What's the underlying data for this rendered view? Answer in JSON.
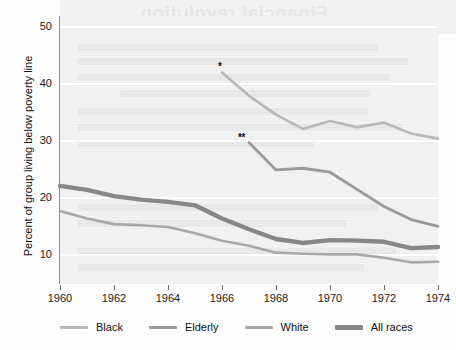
{
  "figure": {
    "y_axis_title": "Percent of group living below poverty line",
    "bleed_text": "Financial revolution",
    "footnote_single": "*",
    "footnote_double": "**"
  },
  "chart_data": {
    "type": "line",
    "title": "",
    "xlabel": "",
    "ylabel": "Percent of group living below poverty line",
    "xlim": [
      1960,
      1974
    ],
    "ylim": [
      5,
      52
    ],
    "yticks": [
      10,
      20,
      30,
      40,
      50
    ],
    "xticks": [
      1960,
      1962,
      1964,
      1966,
      1968,
      1970,
      1972,
      1974
    ],
    "grid": "horizontal-white",
    "legend_position": "below",
    "series": [
      {
        "name": "Black",
        "color": "#b8b8b8",
        "width": 2.6,
        "marker_note": "*",
        "x": [
          1966,
          1967,
          1968,
          1969,
          1970,
          1971,
          1972,
          1973,
          1974
        ],
        "values": [
          42.1,
          38.0,
          34.7,
          32.2,
          33.6,
          32.5,
          33.3,
          31.4,
          30.5
        ]
      },
      {
        "name": "Elderly",
        "color": "#9a9a9a",
        "width": 2.8,
        "marker_note": "**",
        "x": [
          1967,
          1968,
          1969,
          1970,
          1971,
          1972,
          1973,
          1974
        ],
        "values": [
          29.8,
          25.0,
          25.3,
          24.6,
          21.6,
          18.6,
          16.3,
          15.1
        ]
      },
      {
        "name": "White",
        "color": "#a8a8a8",
        "width": 2.6,
        "marker_note": "",
        "x": [
          1960,
          1961,
          1962,
          1963,
          1964,
          1965,
          1966,
          1967,
          1968,
          1969,
          1970,
          1971,
          1972,
          1973,
          1974
        ],
        "values": [
          17.8,
          16.5,
          15.5,
          15.3,
          15.0,
          13.9,
          12.6,
          11.7,
          10.5,
          10.3,
          10.2,
          10.2,
          9.6,
          8.8,
          8.9
        ]
      },
      {
        "name": "All races",
        "color": "#878787",
        "width": 4.4,
        "marker_note": "",
        "x": [
          1960,
          1961,
          1962,
          1963,
          1964,
          1965,
          1966,
          1967,
          1968,
          1969,
          1970,
          1971,
          1972,
          1973,
          1974
        ],
        "values": [
          22.2,
          21.5,
          20.4,
          19.8,
          19.4,
          18.8,
          16.5,
          14.6,
          12.9,
          12.2,
          12.7,
          12.6,
          12.4,
          11.3,
          11.5
        ]
      }
    ]
  },
  "legend": {
    "items": [
      {
        "label": "Black",
        "color": "#b8b8b8",
        "thickness": 3
      },
      {
        "label": "Elderly",
        "color": "#9a9a9a",
        "thickness": 3
      },
      {
        "label": "White",
        "color": "#a8a8a8",
        "thickness": 3
      },
      {
        "label": "All races",
        "color": "#878787",
        "thickness": 5
      }
    ]
  }
}
